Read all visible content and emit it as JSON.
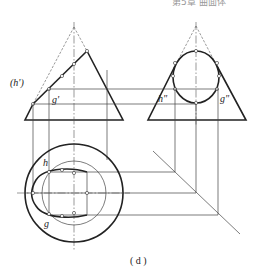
{
  "header": {
    "text": "第5章 曲面体"
  },
  "caption": "( d )",
  "labels": {
    "front_h": "(h')",
    "front_g": "g'",
    "side_h": "h\"",
    "side_g": "g\"",
    "top_h": "h",
    "top_g": "g"
  },
  "colors": {
    "line": "#222222",
    "background": "#ffffff"
  }
}
